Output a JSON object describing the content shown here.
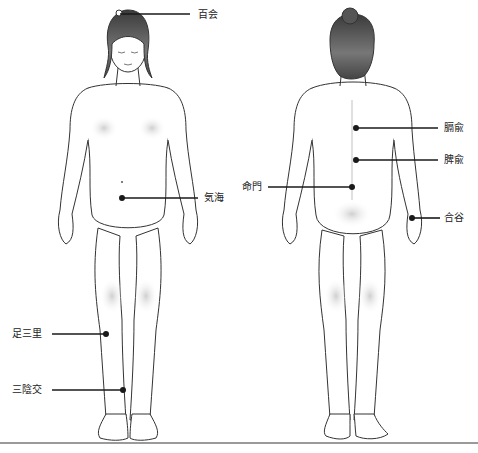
{
  "diagram": {
    "title": "",
    "figures": [
      {
        "id": "front",
        "description": "female figure front view"
      },
      {
        "id": "back",
        "description": "female figure back view"
      }
    ],
    "acupoints": [
      {
        "key": "hyakue",
        "label": "百会",
        "figure": "front",
        "region": "crown of head"
      },
      {
        "key": "kikai",
        "label": "気海",
        "figure": "front",
        "region": "lower abdomen"
      },
      {
        "key": "ashisanri",
        "label": "足三里",
        "figure": "front",
        "region": "below knee"
      },
      {
        "key": "sanninko",
        "label": "三陰交",
        "figure": "front",
        "region": "inner ankle"
      },
      {
        "key": "kakuyu",
        "label": "膈兪",
        "figure": "back",
        "region": "upper back"
      },
      {
        "key": "hiyu",
        "label": "脾兪",
        "figure": "back",
        "region": "mid back"
      },
      {
        "key": "meimon",
        "label": "命門",
        "figure": "back",
        "region": "lower back"
      },
      {
        "key": "goukoku",
        "label": "合谷",
        "figure": "back",
        "region": "hand"
      }
    ],
    "colors": {
      "line": "#1a1a1a",
      "outline": "#333333",
      "skin_shade": "#d8d8d8",
      "hair": "#555555",
      "floor": "#9a9a9a"
    }
  }
}
